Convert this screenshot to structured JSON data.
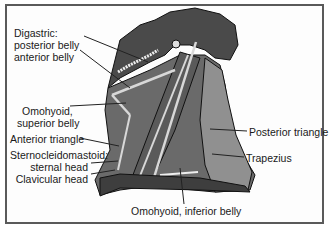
{
  "diagram": {
    "labels": {
      "digastric_title": "Digastric:",
      "digastric_posterior": "posterior belly",
      "digastric_anterior": "anterior belly",
      "omohyoid_title": "Omohyoid,",
      "omohyoid_superior": "superior belly",
      "anterior_triangle": "Anterior triangle",
      "scm_title": "Sternocleidomastoid:",
      "scm_sternal": "sternal head",
      "scm_clavicular": "Clavicular head",
      "posterior_triangle": "Posterior triangle",
      "trapezius": "Trapezius",
      "omohyoid_inferior": "Omohyoid, inferior belly"
    },
    "colors": {
      "border": "#5a5a5a",
      "head": "#4a4a4a",
      "muscle_dark": "#5e5e5e",
      "muscle_mid": "#7a7a7a",
      "muscle_light": "#9a9a9a",
      "highlight": "#d8d8d8",
      "leader": "#222222"
    }
  }
}
